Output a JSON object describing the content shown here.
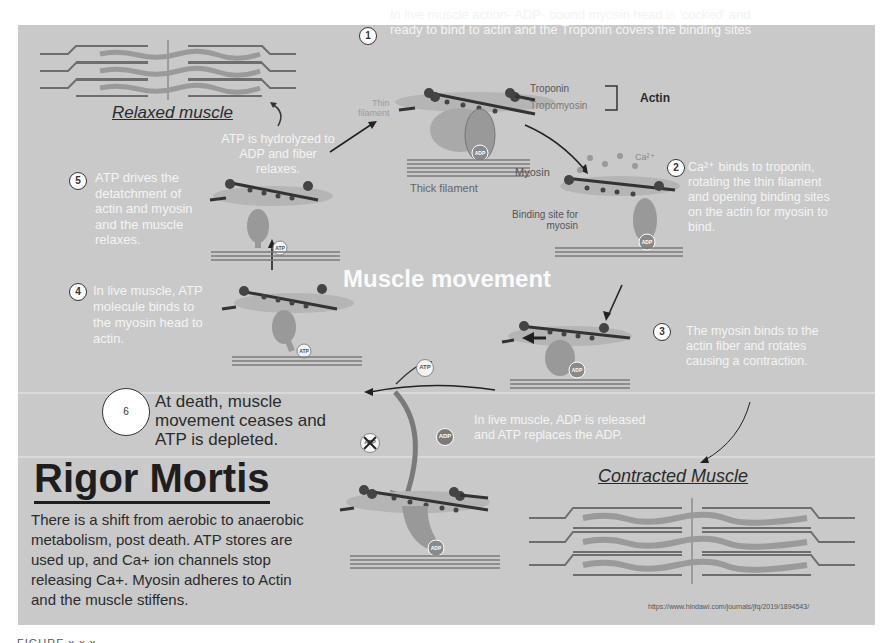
{
  "figure": {
    "title": "Muscle movement",
    "caption_cut": "FIGURE x.x.x",
    "source_url": "https://www.hindawi.com/journals/jfq/2019/1894543/",
    "colors": {
      "panel_bg": "#c9c9c9",
      "white_text": "#f4f4f4",
      "dark_text": "#2b2b2b",
      "filament": "#7a7a7a",
      "actin_blob": "#b0b0b0"
    }
  },
  "relaxed": {
    "label": "Relaxed muscle"
  },
  "contracted": {
    "label": "Contracted Muscle"
  },
  "steps": [
    {
      "num": "1",
      "text_line1": "In live muscle action- ADP- bound myosin head is 'cocked' and",
      "text_line2": "ready to bind to actin and the Troponin covers the binding sites"
    },
    {
      "num": "2",
      "lines": [
        "Ca²⁺ binds to troponin,",
        "rotating the thin filament",
        "and opening binding sites",
        "on the actin for myosin to",
        "bind."
      ]
    },
    {
      "num": "3",
      "lines": [
        "The myosin binds to the",
        "actin fiber and rotates",
        "causing a contraction."
      ]
    },
    {
      "num": "4",
      "lines": [
        "In live muscle, ATP",
        "molecule binds to",
        "the myosin head to",
        "actin."
      ]
    },
    {
      "num": "5",
      "lines": [
        "ATP drives the",
        "detatchment of",
        "actin and myosin",
        "and the muscle",
        "relaxes."
      ]
    },
    {
      "num": "6",
      "lines": [
        "At death, muscle",
        "movement ceases and",
        "ATP is depleted."
      ]
    }
  ],
  "annotations": {
    "hydrolyzed": [
      "ATP is hydrolyzed to",
      "ADP and fiber relaxes."
    ],
    "adp_released": [
      "In live muscle, ADP is released",
      "and ATP replaces the ADP."
    ],
    "troponin": "Troponin",
    "tropomyosin": "Tropomyosin",
    "actin": "Actin",
    "thin_filament": [
      "Thin",
      "filament"
    ],
    "myosin": "Myosin",
    "thick_filament": "Thick filament",
    "binding_site": [
      "Binding site for",
      "myosin"
    ],
    "calcium": "Ca²⁺"
  },
  "badges": {
    "adp": "ADP",
    "atp": "ATP"
  },
  "rigor": {
    "title": "Rigor Mortis",
    "lines": [
      "There is a shift from aerobic to anaerobic",
      "metabolism, post death.  ATP stores are",
      "used up, and Ca+ ion channels stop",
      "releasing Ca+.  Myosin adheres to Actin",
      "and the muscle stiffens."
    ]
  }
}
